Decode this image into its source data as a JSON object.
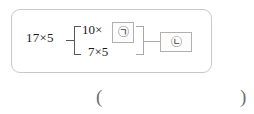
{
  "problem": {
    "diagram": {
      "left_operand": "17×5",
      "decomposition": {
        "top_expression": "10×",
        "top_blank_label": "㉠",
        "bottom_expression": "7×5"
      },
      "result_blank_label": "㉡"
    },
    "answer_field": {
      "open_paren": "(",
      "close_paren": ")"
    }
  },
  "style": {
    "panel_border_color": "#c9c9c9",
    "line_color": "#575757",
    "blank_border_color": "#b0b0b0",
    "text_color": "#1b1b1b",
    "paren_color": "#6e6e6e"
  }
}
